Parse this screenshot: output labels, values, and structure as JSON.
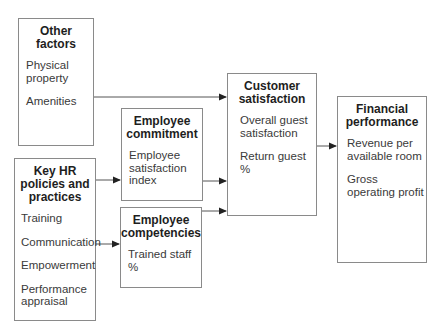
{
  "diagram": {
    "boxes": {
      "other_factors": {
        "title": "Other factors",
        "title_lines": [
          "Other",
          "factors"
        ],
        "items": [
          "Physical property",
          "Amenities"
        ],
        "item_lines": [
          [
            "Physical",
            "property"
          ],
          [
            "Amenities"
          ]
        ]
      },
      "employee_commitment": {
        "title": "Employee commitment",
        "title_lines": [
          "Employee",
          "commitment"
        ],
        "items": [
          "Employee satisfaction index"
        ],
        "item_lines": [
          [
            "Employee",
            "satisfaction",
            "index"
          ]
        ]
      },
      "key_hr": {
        "title": "Key HR policies and practices",
        "title_lines": [
          "Key HR",
          "policies and",
          "practices"
        ],
        "items": [
          "Training",
          "Communication",
          "Empowerment",
          "Performance appraisal"
        ],
        "item_lines": [
          [
            "Training"
          ],
          [
            "Communication"
          ],
          [
            "Empowerment"
          ],
          [
            "Performance",
            "appraisal"
          ]
        ]
      },
      "employee_competencies": {
        "title": "Employee competencies",
        "title_lines": [
          "Employee",
          "competencies"
        ],
        "items": [
          "Trained staff %"
        ],
        "item_lines": [
          [
            "Trained staff %"
          ]
        ]
      },
      "customer_satisfaction": {
        "title": "Customer satisfaction",
        "title_lines": [
          "Customer",
          "satisfaction"
        ],
        "items": [
          "Overall guest satisfaction",
          "Return guest %"
        ],
        "item_lines": [
          [
            "Overall guest",
            "satisfaction"
          ],
          [
            "Return guest %"
          ]
        ]
      },
      "financial_performance": {
        "title": "Financial performance",
        "title_lines": [
          "Financial",
          "performance"
        ],
        "items": [
          "Revenue per available room",
          "Gross operating profit"
        ],
        "item_lines": [
          [
            "Revenue per",
            "available room"
          ],
          [
            "Gross",
            "operating profit"
          ]
        ]
      }
    },
    "edges": [
      {
        "from": "Other factors",
        "to": "Customer satisfaction"
      },
      {
        "from": "Key HR policies and practices",
        "to": "Employee commitment"
      },
      {
        "from": "Key HR policies and practices",
        "to": "Employee competencies"
      },
      {
        "from": "Employee commitment",
        "to": "Customer satisfaction"
      },
      {
        "from": "Employee competencies",
        "to": "Customer satisfaction"
      },
      {
        "from": "Customer satisfaction",
        "to": "Financial performance"
      }
    ],
    "colors": {
      "border": "#8a8a8a",
      "line": "#555555",
      "text": "#2a2a2a"
    }
  }
}
